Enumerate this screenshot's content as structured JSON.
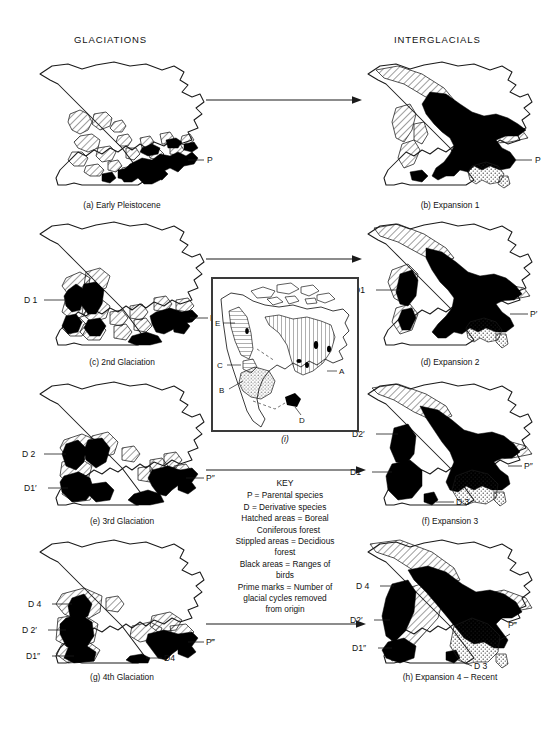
{
  "figure": {
    "columns": {
      "left_header": "GLACIATIONS",
      "right_header": "INTERGLACIALS"
    },
    "panels": [
      {
        "id": "a",
        "caption": "(a) Early Pleistocene",
        "column": "glaciations",
        "labels": [
          {
            "text": "P",
            "name": "label-p"
          }
        ]
      },
      {
        "id": "b",
        "caption": "(b) Expansion 1",
        "column": "interglacials",
        "labels": [
          {
            "text": "P",
            "name": "label-p"
          }
        ]
      },
      {
        "id": "c",
        "caption": "(c) 2nd Glaciation",
        "column": "glaciations",
        "labels": [
          {
            "text": "D 1",
            "name": "label-d1"
          },
          {
            "text": "P′",
            "name": "label-p-prime"
          }
        ]
      },
      {
        "id": "d",
        "caption": "(d) Expansion 2",
        "column": "interglacials",
        "labels": [
          {
            "text": "D1",
            "name": "label-d1"
          },
          {
            "text": "P′",
            "name": "label-p-prime"
          }
        ]
      },
      {
        "id": "e",
        "caption": "(e) 3rd Glaciation",
        "column": "glaciations",
        "labels": [
          {
            "text": "D 2",
            "name": "label-d2"
          },
          {
            "text": "D1′",
            "name": "label-d1-prime"
          },
          {
            "text": "P″",
            "name": "label-p-double-prime"
          }
        ]
      },
      {
        "id": "f",
        "caption": "(f) Expansion 3",
        "column": "interglacials",
        "labels": [
          {
            "text": "D2′",
            "name": "label-d2-prime"
          },
          {
            "text": "D1′",
            "name": "label-d1-prime"
          },
          {
            "text": "P″",
            "name": "label-p-double-prime"
          },
          {
            "text": "D 3",
            "name": "label-d3"
          }
        ]
      },
      {
        "id": "g",
        "caption": "(g) 4th Glaciation",
        "column": "glaciations",
        "labels": [
          {
            "text": "D 4",
            "name": "label-d4"
          },
          {
            "text": "D 2′",
            "name": "label-d2-prime"
          },
          {
            "text": "D1″",
            "name": "label-d1-double-prime"
          },
          {
            "text": "D4",
            "name": "label-d4-lower"
          },
          {
            "text": "P‴",
            "name": "label-p-triple-prime"
          }
        ]
      },
      {
        "id": "h",
        "caption": "(h) Expansion 4 – Recent",
        "column": "interglacials",
        "labels": [
          {
            "text": "D 4",
            "name": "label-d4"
          },
          {
            "text": "D2′",
            "name": "label-d2-prime"
          },
          {
            "text": "D1″",
            "name": "label-d1-double-prime"
          },
          {
            "text": "D 3",
            "name": "label-d3"
          },
          {
            "text": "P‴",
            "name": "label-p-triple-prime"
          }
        ]
      }
    ],
    "inset": {
      "caption": "(i)",
      "labels": [
        {
          "text": "A",
          "name": "inset-label-a"
        },
        {
          "text": "B",
          "name": "inset-label-b"
        },
        {
          "text": "C",
          "name": "inset-label-c"
        },
        {
          "text": "D",
          "name": "inset-label-d"
        },
        {
          "text": "E",
          "name": "inset-label-e"
        }
      ]
    },
    "key": {
      "title": "KEY",
      "lines": [
        "P = Parental species",
        "D = Derivative species",
        "Hatched areas = Boreal\n   Coniferous forest",
        "Stippled areas = Decidious\nforest",
        "Black areas = Ranges of\nbirds",
        "Prime marks = Number of\nglacial cycles removed\nfrom origin"
      ]
    },
    "colors": {
      "ink": "#1a1a1a",
      "black_range": "#000000",
      "paper": "#ffffff",
      "inset_border": "#3a3a3a"
    }
  }
}
